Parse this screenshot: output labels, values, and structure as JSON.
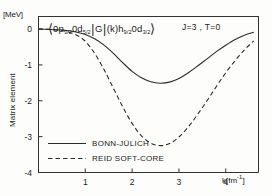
{
  "figure": {
    "y_unit": "[MeV]",
    "y_axis_label": "Matrix element",
    "x_axis_label": "k[fm",
    "x_axis_label_exp": "-1",
    "x_axis_label_end": "]",
    "quantum_numbers": "J=3 , T=0",
    "formula": {
      "bra_open": "⟨",
      "bra_orb1": "0p",
      "bra_orb1_sub": "3/2",
      "bra_orb2": "0d",
      "bra_orb2_sub": "5/2",
      "operator_bar": "|",
      "operator": "G",
      "operator_arg_bar": "|",
      "ket_arg": "(k)h",
      "ket_arg_sub": "9/2",
      "ket_orb2": "0d",
      "ket_orb2_sub": "3/2",
      "ket_close": "⟩"
    }
  },
  "chart_data": {
    "type": "line",
    "xlabel": "k[fm^-1]",
    "ylabel": "Matrix element",
    "yunit": "MeV",
    "xlim": [
      0,
      4.7
    ],
    "ylim": [
      -4,
      0.35
    ],
    "xticks": [
      1,
      2,
      3,
      4
    ],
    "yticks": [
      0,
      -1,
      -2,
      -3,
      -4
    ],
    "grid": false,
    "legend_position": "lower-left-inside",
    "series": [
      {
        "name": "BONN-JÜLICH",
        "style": "solid",
        "color": "#2b2b2b",
        "x": [
          0.0,
          0.2,
          0.4,
          0.6,
          0.8,
          1.0,
          1.2,
          1.4,
          1.6,
          1.8,
          2.0,
          2.2,
          2.4,
          2.6,
          2.8,
          3.0,
          3.2,
          3.4,
          3.6,
          3.8,
          4.0,
          4.2,
          4.4,
          4.6
        ],
        "y": [
          0.0,
          -0.01,
          -0.02,
          -0.04,
          -0.08,
          -0.15,
          -0.27,
          -0.45,
          -0.68,
          -0.94,
          -1.18,
          -1.36,
          -1.47,
          -1.51,
          -1.48,
          -1.38,
          -1.22,
          -1.03,
          -0.83,
          -0.63,
          -0.45,
          -0.29,
          -0.17,
          -0.09
        ]
      },
      {
        "name": "REID SOFT-CORE",
        "style": "dashed",
        "color": "#2b2b2b",
        "x": [
          0.0,
          0.2,
          0.4,
          0.6,
          0.8,
          1.0,
          1.2,
          1.4,
          1.6,
          1.8,
          2.0,
          2.2,
          2.4,
          2.6,
          2.8,
          3.0,
          3.2,
          3.4,
          3.6,
          3.8,
          4.0,
          4.2,
          4.4,
          4.6
        ],
        "y": [
          0.0,
          -0.01,
          -0.03,
          -0.07,
          -0.16,
          -0.34,
          -0.68,
          -1.13,
          -1.65,
          -2.17,
          -2.63,
          -2.98,
          -3.18,
          -3.25,
          -3.19,
          -3.01,
          -2.73,
          -2.38,
          -2.0,
          -1.6,
          -1.22,
          -0.88,
          -0.58,
          -0.33
        ]
      }
    ]
  },
  "legend": {
    "items": [
      {
        "label": "BONN-JÜLICH",
        "style": "solid"
      },
      {
        "label": "REID SOFT-CORE",
        "style": "dashed"
      }
    ]
  }
}
